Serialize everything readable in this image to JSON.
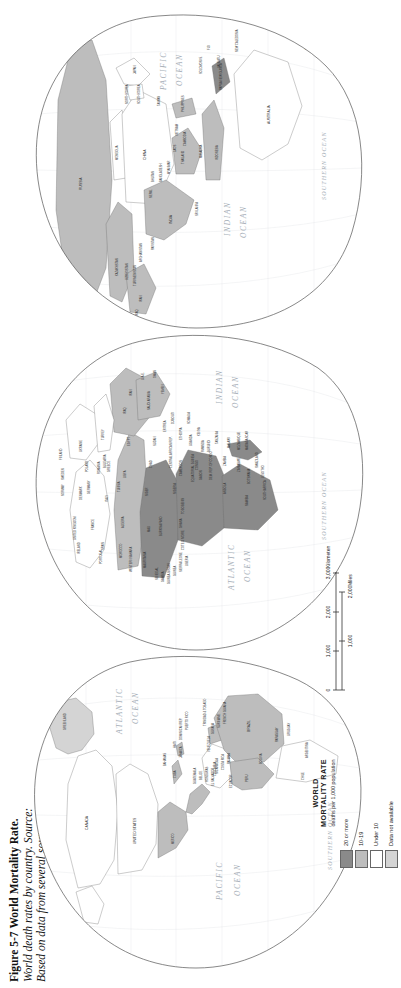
{
  "figure": {
    "number": "Figure 5-7",
    "title": "World Mortality Rate.",
    "description": "World death rates by country.",
    "source_label": "Source:",
    "source_text": "Based on data from several sources."
  },
  "legend": {
    "title_line1": "WORLD",
    "title_line2": "MORTALITY RATE",
    "subtitle": "deaths per 1,000 population",
    "items": [
      {
        "label": "20 or more",
        "color": "#8a8a8a"
      },
      {
        "label": "10-19",
        "color": "#bdbdbd"
      },
      {
        "label": "Under 10",
        "color": "#ffffff"
      },
      {
        "label": "Data not available",
        "color": "#d4d4d4"
      }
    ]
  },
  "scale": {
    "km_ticks": [
      "0",
      "1,000",
      "2,000",
      "3,000"
    ],
    "km_unit": "Kilometers",
    "mi_ticks": [
      "0",
      "1,000",
      "2,000"
    ],
    "mi_unit": "Miles"
  },
  "oceans": [
    {
      "name": "PACIFIC OCEAN",
      "line1": "PACIFIC",
      "line2": "OCEAN"
    },
    {
      "name": "ATLANTIC OCEAN",
      "line1": "ATLANTIC",
      "line2": "OCEAN"
    },
    {
      "name": "INDIAN OCEAN",
      "line1": "INDIAN",
      "line2": "OCEAN"
    },
    {
      "name": "SOUTHERN OCEAN",
      "line1": "SOUTHERN",
      "line2": "OCEAN"
    },
    {
      "name": "ARCTIC OCEAN",
      "line1": "ARCTIC",
      "line2": "OCEAN"
    }
  ],
  "map_labels": {
    "americas": [
      "CANADA",
      "UNITED STATES",
      "MEXICO",
      "GUATEMALA",
      "BELIZE",
      "HONDURAS",
      "EL SALVADOR",
      "NICARAGUA",
      "COSTA RICA",
      "PANAMA",
      "CUBA",
      "JAMAICA",
      "HAITI",
      "DOMINICAN REP.",
      "PUERTO RICO",
      "BAHAMAS",
      "TRINIDAD & TOBAGO",
      "COLOMBIA",
      "VENEZUELA",
      "GUYANA",
      "SURINAME",
      "FRENCH GUIANA",
      "ECUADOR",
      "PERU",
      "BRAZIL",
      "BOLIVIA",
      "PARAGUAY",
      "CHILE",
      "ARGENTINA",
      "URUGUAY",
      "GREENLAND",
      "ICELAND"
    ],
    "africa_europe": [
      "MOROCCO",
      "ALGERIA",
      "TUNISIA",
      "LIBYA",
      "EGYPT",
      "WESTERN SAHARA",
      "MAURITANIA",
      "MALI",
      "NIGER",
      "CHAD",
      "SUDAN",
      "ERITREA",
      "DJIBOUTI",
      "ETHIOPIA",
      "SOMALIA",
      "SENEGAL",
      "GAMBIA",
      "GUINEA-BISSAU",
      "GUINEA",
      "SIERRA LEONE",
      "LIBERIA",
      "COTE D'IVOIRE",
      "BURKINA FASO",
      "GHANA",
      "TOGO",
      "BENIN",
      "NIGERIA",
      "CAMEROON",
      "CENTRAL AFRICAN REP.",
      "EQUATORIAL GUINEA",
      "GABON",
      "CONGO",
      "DEM. REP. OF CONGO",
      "UGANDA",
      "KENYA",
      "RWANDA",
      "BURUNDI",
      "TANZANIA",
      "ANGOLA",
      "ZAMBIA",
      "MALAWI",
      "MOZAMBIQUE",
      "ZIMBABWE",
      "BOTSWANA",
      "NAMIBIA",
      "SOUTH AFRICA",
      "LESOTHO",
      "SWAZILAND",
      "MADAGASCAR",
      "PORTUGAL",
      "SPAIN",
      "FRANCE",
      "IRELAND",
      "UNITED KINGDOM",
      "NORWAY",
      "SWEDEN",
      "FINLAND",
      "DENMARK",
      "GERMANY",
      "POLAND",
      "ITALY",
      "GREECE",
      "TURKEY",
      "UKRAINE",
      "ROMANIA",
      "BULGARIA"
    ],
    "asia_oceania": [
      "RUSSIA",
      "KAZAKHSTAN",
      "UZBEKISTAN",
      "TURKMENISTAN",
      "AFGHANISTAN",
      "PAKISTAN",
      "IRAN",
      "IRAQ",
      "SAUDI ARABIA",
      "YEMEN",
      "OMAN",
      "U.A.E.",
      "INDIA",
      "NEPAL",
      "BHUTAN",
      "BANGLADESH",
      "SRI LANKA",
      "MYANMAR",
      "THAILAND",
      "LAOS",
      "CAMBODIA",
      "VIETNAM",
      "MALAYSIA",
      "INDONESIA",
      "PHILIPPINES",
      "CHINA",
      "MONGOLIA",
      "NORTH KOREA",
      "SOUTH KOREA",
      "JAPAN",
      "TAIWAN",
      "PAPUA NEW GUINEA",
      "AUSTRALIA",
      "NEW ZEALAND",
      "FIJI",
      "SOLOMON IS.",
      "NEW CALEDONIA",
      "VANUATU"
    ]
  },
  "colors": {
    "high": "#8a8a8a",
    "mid": "#bdbdbd",
    "low": "#ffffff",
    "nodata": "#d4d4d4",
    "outline": "#555555",
    "ocean_text": "#9aa3ad",
    "page_bg": "#ffffff"
  }
}
